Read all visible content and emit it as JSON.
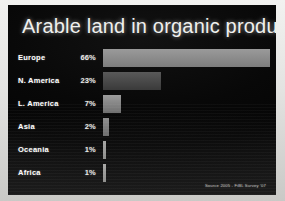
{
  "slide": {
    "title": "Arable land in organic production",
    "source_credit": "Source 2005 - FiBL Survey '07",
    "background_color": "#080808",
    "frame_color": "#e3e3e1",
    "title_color": "#f0f0ee",
    "label_color": "#ffffff",
    "value_color": "#e9e9e7"
  },
  "chart_data": {
    "type": "bar",
    "orientation": "horizontal",
    "title": "Arable land in organic production",
    "xlabel": "",
    "ylabel": "",
    "categories": [
      "Europe",
      "N. America",
      "L. America",
      "Asia",
      "Oceania",
      "Africa"
    ],
    "values": [
      66,
      23,
      7,
      2,
      1,
      1
    ],
    "value_labels": [
      "66%",
      "23%",
      "7%",
      "2%",
      "1%",
      "1%"
    ],
    "unit": "%",
    "xlim": [
      0,
      66
    ],
    "grid": false,
    "legend": false,
    "bar_colors": [
      "#8c8c8c",
      "#4a4a4a",
      "#8a8a8a",
      "#7e7e7e",
      "#9a9a98",
      "#9a9a98"
    ],
    "annotation": "Source 2005 - FiBL Survey '07"
  },
  "rows": [
    {
      "label": "Europe",
      "value_label": "66%",
      "width_pct": 100.0,
      "color_start": "#9a9a9a",
      "color_end": "#7d7d7d"
    },
    {
      "label": "N. America",
      "value_label": "23%",
      "width_pct": 35.0,
      "color_start": "#595959",
      "color_end": "#3a3a3a"
    },
    {
      "label": "L. America",
      "value_label": "7%",
      "width_pct": 11.0,
      "color_start": "#9b9b9b",
      "color_end": "#6f6f6f"
    },
    {
      "label": "Asia",
      "value_label": "2%",
      "width_pct": 3.6,
      "color_start": "#8e8e8e",
      "color_end": "#6a6a6a"
    },
    {
      "label": "Oceania",
      "value_label": "1%",
      "width_pct": 1.9,
      "color_start": "#a6a6a4",
      "color_end": "#8a8a88"
    },
    {
      "label": "Africa",
      "value_label": "1%",
      "width_pct": 1.9,
      "color_start": "#a6a6a4",
      "color_end": "#8a8a88"
    }
  ]
}
